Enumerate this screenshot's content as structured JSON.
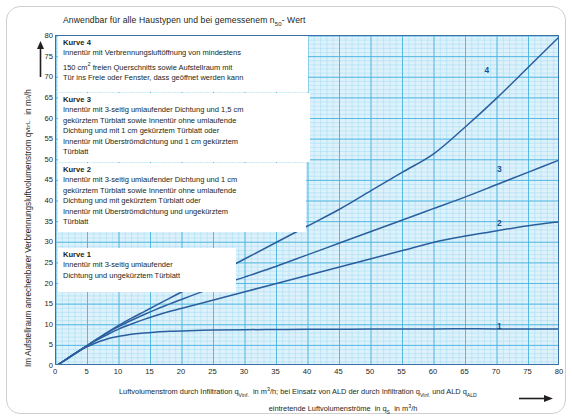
{
  "chart_data": {
    "type": "line",
    "title": "Anwendbar für alle Haustypen und bei gemessenem n50- Wert",
    "title_main": "Anwendbar für alle Haustypen und bei gemessenem n",
    "title_sub": "50",
    "title_tail": "- Wert",
    "xlabel_line1": "Luftvolumenstrom durch Infiltration qVinf. in m3/h; bei Einsatz von ALD der durch Infiltration qVinf. und ALD qALD",
    "xlabel_line2": "eintretende Luftvolumenströme in qS in m3/h",
    "ylabel": "Im Aufstellraum anrechenbarer Verbrennungsluftvolumenstrom qVbrL. in m3/h",
    "xlim": [
      0,
      80
    ],
    "ylim": [
      0,
      80
    ],
    "xticks": [
      0,
      5,
      10,
      15,
      20,
      25,
      30,
      35,
      40,
      45,
      50,
      55,
      60,
      65,
      70,
      75,
      80
    ],
    "yticks": [
      0,
      5,
      10,
      15,
      20,
      25,
      30,
      35,
      40,
      45,
      50,
      55,
      60,
      65,
      70,
      75,
      80
    ],
    "grid": true,
    "grid_minor_step": 1,
    "grid_major_step": 5,
    "legend_position": "upper-left-overlay",
    "line_color": "#2a5f9e",
    "grid_minor_color": "#9ddcf2",
    "grid_major_color": "#4ab4e0",
    "plot_bg": "#dff1fb",
    "series": [
      {
        "name": "1",
        "label": "Kurve 1",
        "points": [
          [
            0,
            0
          ],
          [
            1,
            1
          ],
          [
            2,
            2
          ],
          [
            3,
            3
          ],
          [
            4,
            3.9
          ],
          [
            5,
            4.7
          ],
          [
            6,
            5.4
          ],
          [
            7,
            6.0
          ],
          [
            8,
            6.5
          ],
          [
            9,
            6.9
          ],
          [
            10,
            7.2
          ],
          [
            12,
            7.7
          ],
          [
            14,
            8.0
          ],
          [
            16,
            8.25
          ],
          [
            18,
            8.4
          ],
          [
            20,
            8.5
          ],
          [
            25,
            8.7
          ],
          [
            30,
            8.8
          ],
          [
            35,
            8.85
          ],
          [
            40,
            8.9
          ],
          [
            50,
            8.95
          ],
          [
            60,
            9.0
          ],
          [
            70,
            9.0
          ],
          [
            80,
            9.0
          ]
        ]
      },
      {
        "name": "2",
        "label": "Kurve 2",
        "points": [
          [
            0,
            0
          ],
          [
            2,
            2
          ],
          [
            4,
            4
          ],
          [
            6,
            5.9
          ],
          [
            8,
            7.5
          ],
          [
            10,
            9.0
          ],
          [
            12,
            10.2
          ],
          [
            14,
            11.3
          ],
          [
            16,
            12.3
          ],
          [
            18,
            13.2
          ],
          [
            20,
            14.0
          ],
          [
            25,
            16.0
          ],
          [
            30,
            18.0
          ],
          [
            35,
            20.0
          ],
          [
            40,
            22.0
          ],
          [
            45,
            24.0
          ],
          [
            50,
            26.0
          ],
          [
            55,
            28.0
          ],
          [
            60,
            30.0
          ],
          [
            65,
            31.5
          ],
          [
            70,
            32.8
          ],
          [
            75,
            34.0
          ],
          [
            80,
            35.0
          ]
        ]
      },
      {
        "name": "3",
        "label": "Kurve 3",
        "points": [
          [
            0,
            0
          ],
          [
            2,
            2
          ],
          [
            4,
            4
          ],
          [
            6,
            6
          ],
          [
            8,
            7.9
          ],
          [
            10,
            9.6
          ],
          [
            12,
            11.1
          ],
          [
            14,
            12.5
          ],
          [
            16,
            13.8
          ],
          [
            18,
            15.0
          ],
          [
            20,
            16.2
          ],
          [
            25,
            19.0
          ],
          [
            30,
            21.6
          ],
          [
            35,
            24.2
          ],
          [
            40,
            27.0
          ],
          [
            45,
            29.8
          ],
          [
            50,
            32.6
          ],
          [
            55,
            35.4
          ],
          [
            60,
            38.2
          ],
          [
            65,
            41.0
          ],
          [
            70,
            44.0
          ],
          [
            75,
            47.0
          ],
          [
            80,
            50.0
          ]
        ]
      },
      {
        "name": "4",
        "label": "Kurve 4",
        "points": [
          [
            0,
            0
          ],
          [
            2,
            2
          ],
          [
            4,
            4
          ],
          [
            6,
            6
          ],
          [
            8,
            8
          ],
          [
            10,
            9.9
          ],
          [
            12,
            11.6
          ],
          [
            14,
            13.2
          ],
          [
            16,
            14.8
          ],
          [
            18,
            16.4
          ],
          [
            20,
            18.0
          ],
          [
            25,
            22.0
          ],
          [
            30,
            26.0
          ],
          [
            35,
            30.0
          ],
          [
            40,
            34.0
          ],
          [
            45,
            38.0
          ],
          [
            50,
            42.5
          ],
          [
            55,
            47.0
          ],
          [
            60,
            51.5
          ],
          [
            65,
            58.0
          ],
          [
            70,
            65.0
          ],
          [
            75,
            72.5
          ],
          [
            80,
            80.0
          ]
        ]
      }
    ],
    "annotations": [
      {
        "text": "1",
        "x": 70,
        "y": 11
      },
      {
        "text": "2",
        "x": 70,
        "y": 36
      },
      {
        "text": "3",
        "x": 70,
        "y": 49
      },
      {
        "text": "4",
        "x": 68,
        "y": 73
      }
    ]
  },
  "legend": {
    "blocks": [
      {
        "title": "Kurve 4",
        "lines": [
          "Innentür mit Verbrennungsluftöffnung von mindestens",
          "150 cm2 freien Querschnitts sowie Aufstellraum mit",
          "Tür ins Freie oder Fenster, dass geöffnet werden kann"
        ]
      },
      {
        "title": "Kurve 3",
        "lines": [
          "Innentür mit 3-seitig umlaufender Dichtung und 1,5 cm",
          "gekürztem Türblatt sowie Innentür ohne umlaufende",
          "Dichtung und mit 1 cm gekürztem Türblatt oder",
          "Innentür mit Überströmdichtung und 1 cm gekürztem",
          "Türblatt"
        ]
      },
      {
        "title": "Kurve 2",
        "lines": [
          "Innentür mit 3-seitig umlaufender Dichtung und 1 cm",
          "gekürztem Türblatt sowie Innentür ohne umlaufende",
          "Dichtung und mit gekürztem Türblatt oder",
          "Innentür mit Überströmdichtung und ungekürztem",
          "Türblatt"
        ]
      },
      {
        "title": "Kurve 1",
        "lines": [
          "Innentür mit 3-seitig umlaufender",
          "Dichtung und ungekürztem Türblatt"
        ]
      }
    ]
  }
}
